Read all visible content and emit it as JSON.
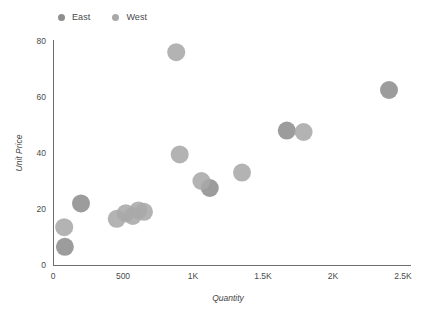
{
  "chart_data": {
    "type": "scatter",
    "title": "",
    "xlabel": "Quantity",
    "ylabel": "Unit Price",
    "xlim": [
      0,
      2500
    ],
    "ylim": [
      0,
      80
    ],
    "grid": false,
    "legend_position": "top-left",
    "x_ticks": [
      {
        "value": 0,
        "label": "0"
      },
      {
        "value": 500,
        "label": "500"
      },
      {
        "value": 1000,
        "label": "1K"
      },
      {
        "value": 1500,
        "label": "1.5K"
      },
      {
        "value": 2000,
        "label": "2K"
      },
      {
        "value": 2500,
        "label": "2.5K"
      }
    ],
    "y_ticks": [
      {
        "value": 0,
        "label": "0"
      },
      {
        "value": 20,
        "label": "20"
      },
      {
        "value": 40,
        "label": "40"
      },
      {
        "value": 60,
        "label": "60"
      },
      {
        "value": 80,
        "label": "80"
      }
    ],
    "series": [
      {
        "name": "East",
        "color": "#8e8e8e",
        "points": [
          {
            "x": 85,
            "y": 6.5
          },
          {
            "x": 200,
            "y": 22.0
          },
          {
            "x": 1120,
            "y": 27.5
          },
          {
            "x": 1670,
            "y": 48.0
          },
          {
            "x": 2400,
            "y": 62.5
          }
        ]
      },
      {
        "name": "West",
        "color": "#a9a9a9",
        "points": [
          {
            "x": 80,
            "y": 13.5
          },
          {
            "x": 455,
            "y": 16.5
          },
          {
            "x": 520,
            "y": 18.5
          },
          {
            "x": 570,
            "y": 17.5
          },
          {
            "x": 610,
            "y": 19.5
          },
          {
            "x": 650,
            "y": 19.0
          },
          {
            "x": 880,
            "y": 76.0
          },
          {
            "x": 905,
            "y": 39.5
          },
          {
            "x": 1060,
            "y": 30.0
          },
          {
            "x": 1350,
            "y": 33.0
          },
          {
            "x": 1790,
            "y": 47.5
          }
        ]
      }
    ]
  },
  "legend": {
    "items": [
      {
        "label": "East",
        "color": "#8e8e8e"
      },
      {
        "label": "West",
        "color": "#a9a9a9"
      }
    ]
  },
  "axes": {
    "x_title": "Quantity",
    "y_title": "Unit Price"
  }
}
